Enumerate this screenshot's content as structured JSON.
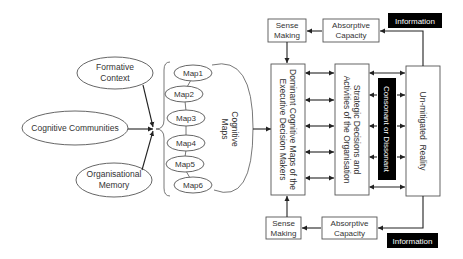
{
  "diagram": {
    "influences": {
      "formative_context": [
        "Formative",
        "Context"
      ],
      "cognitive_communities": "Cognitive Communities",
      "organisational_memory": [
        "Organisational",
        "Memory"
      ]
    },
    "maps": [
      "Map1",
      "Map2",
      "Map3",
      "Map4",
      "Map5",
      "Map6"
    ],
    "cognitive_maps_label": [
      "Cognitive",
      "Maps"
    ],
    "dominant_box": [
      "Dominant Cognitive Maps of the",
      "Executive Decision Makers"
    ],
    "strategic_box": [
      "Strategic Decisions and",
      "Activities of the Organisation"
    ],
    "consonant_box": "Consonant or Dissonant",
    "reality_box": "Un-mitigated  Reality",
    "top": {
      "sense_making": [
        "Sense",
        "Making"
      ],
      "absorptive_capacity": [
        "Absorptive",
        "Capacity"
      ],
      "information": "Information"
    },
    "bottom": {
      "sense_making": [
        "Sense",
        "Making"
      ],
      "absorptive_capacity": [
        "Absorptive",
        "Capacity"
      ],
      "information": "Information"
    },
    "colors": {
      "box_stroke": "#555555",
      "line": "#222222",
      "dark_fill": "#000000",
      "text": "#333333"
    }
  }
}
